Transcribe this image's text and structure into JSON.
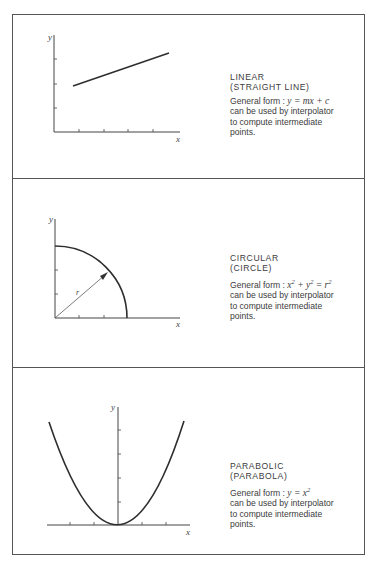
{
  "panels": [
    {
      "id": "linear",
      "title": "LINEAR",
      "subtitle": "(STRAIGHT LINE)",
      "formula_prefix": "General form : ",
      "formula": "y = mx + c",
      "desc_line1": "can be used by interpolator",
      "desc_line2": "to compute intermediate",
      "desc_line3": "points.",
      "x_label": "x",
      "y_label": "y",
      "radius_label": ""
    },
    {
      "id": "circular",
      "title": "CIRCULAR",
      "subtitle": "(CIRCLE)",
      "formula_prefix": "General form : ",
      "formula_parts": [
        "x",
        "2",
        " + y",
        "2",
        " = r",
        "2"
      ],
      "desc_line1": "can be used by interpolator",
      "desc_line2": "to compute intermediate",
      "desc_line3": "points.",
      "x_label": "x",
      "y_label": "y",
      "radius_label": "r"
    },
    {
      "id": "parabolic",
      "title": "PARABOLIC",
      "subtitle": "(PARABOLA)",
      "formula_prefix": "General form : ",
      "formula_parts": [
        "y = x",
        "2"
      ],
      "desc_line1": "can be used by interpolator",
      "desc_line2": "to compute intermediate",
      "desc_line3": "points.",
      "x_label": "x",
      "y_label": "y",
      "radius_label": ""
    }
  ],
  "colors": {
    "line": "#333333",
    "text": "#3c3c3c",
    "border": "#555555"
  }
}
